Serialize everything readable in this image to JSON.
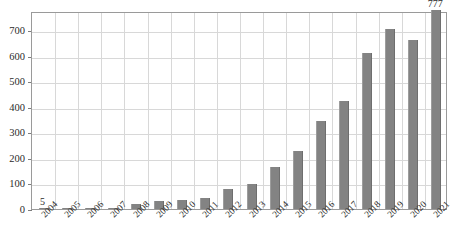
{
  "chart_data": {
    "type": "bar",
    "title": "",
    "subtitle": "",
    "xlabel": "",
    "ylabel": "",
    "categories": [
      "2004",
      "2005",
      "2006",
      "2007",
      "2008",
      "2009",
      "2010",
      "2011",
      "2012",
      "2013",
      "2014",
      "2015",
      "2016",
      "2017",
      "2018",
      "2019",
      "2020",
      "2021"
    ],
    "values": [
      5,
      2,
      3,
      4,
      18,
      32,
      37,
      42,
      79,
      98,
      165,
      228,
      345,
      422,
      610,
      703,
      660,
      777
    ],
    "series": [
      {
        "name": "Publications per year",
        "values": [
          5,
          2,
          3,
          4,
          18,
          32,
          37,
          42,
          79,
          98,
          165,
          228,
          345,
          422,
          610,
          703,
          660,
          777
        ]
      }
    ],
    "ylim": [
      0,
      774
    ],
    "yticks": [
      0,
      100,
      200,
      300,
      400,
      500,
      600,
      700
    ],
    "ytick_labels": [
      "0",
      "100",
      "200",
      "300",
      "400",
      "500",
      "600",
      "700"
    ],
    "grid": true,
    "grid_x": true,
    "grid_y": true,
    "legend": false,
    "legend_position": "none",
    "bar_color": "#838383",
    "grid_color": "#d8d8d8",
    "axis_color": "#9a9a9a",
    "annotations": [
      {
        "id": "first",
        "label": "5",
        "category": "2004",
        "value": 5
      },
      {
        "id": "last",
        "label": "777",
        "category": "2021",
        "value": 777
      }
    ]
  }
}
